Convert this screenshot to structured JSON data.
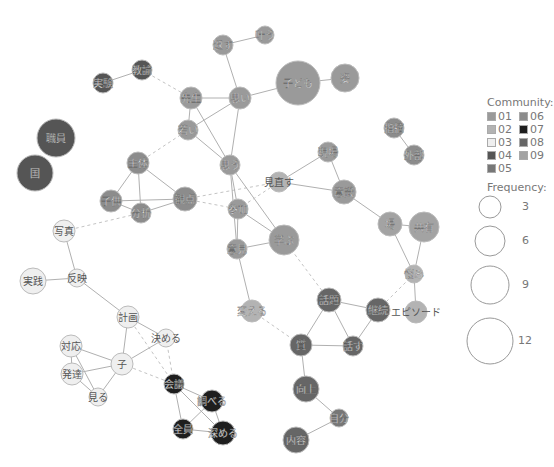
{
  "communities": {
    "01": "#9a9a9a",
    "02": "#b3b3b3",
    "03": "#efefef",
    "04": "#555555",
    "05": "#777777",
    "06": "#8c8c8c",
    "07": "#1e1e1e",
    "08": "#666666",
    "09": "#a3a3a3"
  },
  "nodes": [
    {
      "id": "kodomo",
      "label": "子ども",
      "x": 298,
      "y": 83,
      "r": 22,
      "c": "01"
    },
    {
      "id": "sugata",
      "label": "姿",
      "x": 345,
      "y": 78,
      "r": 14,
      "c": "01"
    },
    {
      "id": "kaesu",
      "label": "返す",
      "x": 223,
      "y": 45,
      "r": 10,
      "c": "01"
    },
    {
      "id": "kanau",
      "label": "叶う",
      "x": 265,
      "y": 35,
      "r": 9,
      "c": "01"
    },
    {
      "id": "sensei",
      "label": "先生",
      "x": 191,
      "y": 98,
      "r": 11,
      "c": "01"
    },
    {
      "id": "omoi",
      "label": "思い",
      "x": 240,
      "y": 98,
      "r": 11,
      "c": "01"
    },
    {
      "id": "wakai",
      "label": "若い",
      "x": 188,
      "y": 130,
      "r": 10,
      "c": "01"
    },
    {
      "id": "omou",
      "label": "思う",
      "x": 230,
      "y": 165,
      "r": 10,
      "c": "01"
    },
    {
      "id": "jikken",
      "label": "実験",
      "x": 103,
      "y": 83,
      "r": 10,
      "c": "04"
    },
    {
      "id": "kyouyu",
      "label": "教諭",
      "x": 142,
      "y": 70,
      "r": 10,
      "c": "04"
    },
    {
      "id": "shokuin",
      "label": "職員",
      "x": 56,
      "y": 138,
      "r": 19,
      "c": "04"
    },
    {
      "id": "kuni",
      "label": "国",
      "x": 35,
      "y": 173,
      "r": 18,
      "c": "04"
    },
    {
      "id": "shutai",
      "label": "主体",
      "x": 138,
      "y": 163,
      "r": 11,
      "c": "06"
    },
    {
      "id": "kodomo2",
      "label": "子供",
      "x": 111,
      "y": 201,
      "r": 11,
      "c": "06"
    },
    {
      "id": "bunseki",
      "label": "分析",
      "x": 141,
      "y": 213,
      "r": 10,
      "c": "06"
    },
    {
      "id": "kanten",
      "label": "観点",
      "x": 185,
      "y": 199,
      "r": 12,
      "c": "06"
    },
    {
      "id": "sanka",
      "label": "参加",
      "x": 238,
      "y": 209,
      "r": 10,
      "c": "01"
    },
    {
      "id": "minaosu",
      "label": "見直す",
      "x": 279,
      "y": 182,
      "r": 10,
      "c": "02"
    },
    {
      "id": "genba",
      "label": "現場",
      "x": 328,
      "y": 152,
      "r": 10,
      "c": "01"
    },
    {
      "id": "ishiki",
      "label": "意識",
      "x": 344,
      "y": 192,
      "r": 12,
      "c": "01"
    },
    {
      "id": "manabu",
      "label": "学ぶ",
      "x": 284,
      "y": 240,
      "r": 15,
      "c": "01"
    },
    {
      "id": "iken",
      "label": "意見",
      "x": 237,
      "y": 249,
      "r": 10,
      "c": "01"
    },
    {
      "id": "shiteki",
      "label": "指摘",
      "x": 394,
      "y": 128,
      "r": 10,
      "c": "06"
    },
    {
      "id": "gaibu",
      "label": "外部",
      "x": 414,
      "y": 155,
      "r": 10,
      "c": "06"
    },
    {
      "id": "ba",
      "label": "場",
      "x": 390,
      "y": 224,
      "r": 12,
      "c": "09"
    },
    {
      "id": "kyouyuu",
      "label": "共有",
      "x": 424,
      "y": 227,
      "r": 15,
      "c": "09"
    },
    {
      "id": "nayami",
      "label": "悩み",
      "x": 414,
      "y": 274,
      "r": 9,
      "c": "02"
    },
    {
      "id": "episode",
      "label": "エピソード",
      "x": 416,
      "y": 312,
      "r": 11,
      "c": "02"
    },
    {
      "id": "kaeru",
      "label": "変える",
      "x": 252,
      "y": 311,
      "r": 11,
      "c": "02"
    },
    {
      "id": "shashin",
      "label": "写真",
      "x": 64,
      "y": 231,
      "r": 11,
      "c": "03"
    },
    {
      "id": "jissen",
      "label": "実践",
      "x": 33,
      "y": 281,
      "r": 13,
      "c": "03"
    },
    {
      "id": "hanei",
      "label": "反映",
      "x": 77,
      "y": 278,
      "r": 9,
      "c": "03"
    },
    {
      "id": "keikaku",
      "label": "計画",
      "x": 128,
      "y": 317,
      "r": 11,
      "c": "03"
    },
    {
      "id": "kimeru",
      "label": "決める",
      "x": 166,
      "y": 338,
      "r": 9,
      "c": "03"
    },
    {
      "id": "taiou",
      "label": "対応",
      "x": 71,
      "y": 346,
      "r": 11,
      "c": "03"
    },
    {
      "id": "ko",
      "label": "子",
      "x": 122,
      "y": 364,
      "r": 11,
      "c": "03"
    },
    {
      "id": "hattatsu",
      "label": "発達",
      "x": 72,
      "y": 374,
      "r": 11,
      "c": "03"
    },
    {
      "id": "miru",
      "label": "見る",
      "x": 98,
      "y": 397,
      "r": 9,
      "c": "03"
    },
    {
      "id": "kaigi",
      "label": "会議",
      "x": 174,
      "y": 384,
      "r": 10,
      "c": "07"
    },
    {
      "id": "shiraberu",
      "label": "調べる",
      "x": 212,
      "y": 401,
      "r": 11,
      "c": "07"
    },
    {
      "id": "zenin",
      "label": "全員",
      "x": 183,
      "y": 429,
      "r": 10,
      "c": "07"
    },
    {
      "id": "fukameru",
      "label": "深める",
      "x": 223,
      "y": 433,
      "r": 12,
      "c": "07"
    },
    {
      "id": "wadai",
      "label": "話題",
      "x": 329,
      "y": 300,
      "r": 12,
      "c": "08"
    },
    {
      "id": "keizoku",
      "label": "継続",
      "x": 378,
      "y": 310,
      "r": 12,
      "c": "08"
    },
    {
      "id": "shitsu",
      "label": "質",
      "x": 301,
      "y": 345,
      "r": 11,
      "c": "08"
    },
    {
      "id": "hanasu",
      "label": "話す",
      "x": 353,
      "y": 346,
      "r": 10,
      "c": "08"
    },
    {
      "id": "koujou",
      "label": "向上",
      "x": 306,
      "y": 389,
      "r": 13,
      "c": "08"
    },
    {
      "id": "jigyou",
      "label": "自分",
      "x": 339,
      "y": 418,
      "r": 9,
      "c": "05"
    },
    {
      "id": "naiyou",
      "label": "内容",
      "x": 296,
      "y": 440,
      "r": 13,
      "c": "08"
    }
  ],
  "edges": [
    {
      "a": "kodomo",
      "b": "sugata",
      "dashed": false
    },
    {
      "a": "kodomo",
      "b": "omoi",
      "dashed": false
    },
    {
      "a": "kaesu",
      "b": "kanau",
      "dashed": false
    },
    {
      "a": "kaesu",
      "b": "omoi",
      "dashed": false
    },
    {
      "a": "sensei",
      "b": "omoi",
      "dashed": false
    },
    {
      "a": "sensei",
      "b": "wakai",
      "dashed": false
    },
    {
      "a": "sensei",
      "b": "omou",
      "dashed": false
    },
    {
      "a": "omoi",
      "b": "wakai",
      "dashed": false
    },
    {
      "a": "omoi",
      "b": "omou",
      "dashed": false
    },
    {
      "a": "wakai",
      "b": "omou",
      "dashed": false
    },
    {
      "a": "jikken",
      "b": "kyouyu",
      "dashed": false
    },
    {
      "a": "kyouyu",
      "b": "sensei",
      "dashed": true
    },
    {
      "a": "shiteki",
      "b": "gaibu",
      "dashed": false
    },
    {
      "a": "shutai",
      "b": "kodomo2",
      "dashed": false
    },
    {
      "a": "shutai",
      "b": "bunseki",
      "dashed": false
    },
    {
      "a": "shutai",
      "b": "kanten",
      "dashed": false
    },
    {
      "a": "kodomo2",
      "b": "bunseki",
      "dashed": false
    },
    {
      "a": "kodomo2",
      "b": "kanten",
      "dashed": false
    },
    {
      "a": "bunseki",
      "b": "kanten",
      "dashed": false
    },
    {
      "a": "shutai",
      "b": "wakai",
      "dashed": true
    },
    {
      "a": "kanten",
      "b": "minaosu",
      "dashed": true
    },
    {
      "a": "kanten",
      "b": "sanka",
      "dashed": true
    },
    {
      "a": "omou",
      "b": "sanka",
      "dashed": false
    },
    {
      "a": "omou",
      "b": "iken",
      "dashed": false
    },
    {
      "a": "omou",
      "b": "manabu",
      "dashed": false
    },
    {
      "a": "sanka",
      "b": "iken",
      "dashed": false
    },
    {
      "a": "sanka",
      "b": "manabu",
      "dashed": false
    },
    {
      "a": "sanka",
      "b": "minaosu",
      "dashed": true
    },
    {
      "a": "iken",
      "b": "manabu",
      "dashed": false
    },
    {
      "a": "iken",
      "b": "kaeru",
      "dashed": false
    },
    {
      "a": "minaosu",
      "b": "genba",
      "dashed": false
    },
    {
      "a": "minaosu",
      "b": "ishiki",
      "dashed": false
    },
    {
      "a": "genba",
      "b": "ishiki",
      "dashed": false
    },
    {
      "a": "ishiki",
      "b": "ba",
      "dashed": false
    },
    {
      "a": "ba",
      "b": "kyouyuu",
      "dashed": false
    },
    {
      "a": "ba",
      "b": "nayami",
      "dashed": false
    },
    {
      "a": "kyouyuu",
      "b": "nayami",
      "dashed": false
    },
    {
      "a": "nayami",
      "b": "episode",
      "dashed": false
    },
    {
      "a": "nayami",
      "b": "keizoku",
      "dashed": true
    },
    {
      "a": "manabu",
      "b": "wadai",
      "dashed": true
    },
    {
      "a": "kaeru",
      "b": "shitsu",
      "dashed": true
    },
    {
      "a": "wadai",
      "b": "keizoku",
      "dashed": false
    },
    {
      "a": "wadai",
      "b": "shitsu",
      "dashed": false
    },
    {
      "a": "wadai",
      "b": "hanasu",
      "dashed": false
    },
    {
      "a": "keizoku",
      "b": "hanasu",
      "dashed": false
    },
    {
      "a": "shitsu",
      "b": "hanasu",
      "dashed": false
    },
    {
      "a": "shitsu",
      "b": "koujou",
      "dashed": false
    },
    {
      "a": "koujou",
      "b": "jigyou",
      "dashed": false
    },
    {
      "a": "jigyou",
      "b": "naiyou",
      "dashed": false
    },
    {
      "a": "shashin",
      "b": "hanei",
      "dashed": false
    },
    {
      "a": "shashin",
      "b": "bunseki",
      "dashed": true
    },
    {
      "a": "jissen",
      "b": "hanei",
      "dashed": false
    },
    {
      "a": "hanei",
      "b": "keikaku",
      "dashed": false
    },
    {
      "a": "keikaku",
      "b": "kimeru",
      "dashed": false
    },
    {
      "a": "keikaku",
      "b": "ko",
      "dashed": false
    },
    {
      "a": "keikaku",
      "b": "kaigi",
      "dashed": true
    },
    {
      "a": "kimeru",
      "b": "ko",
      "dashed": false
    },
    {
      "a": "kimeru",
      "b": "kaigi",
      "dashed": true
    },
    {
      "a": "ko",
      "b": "taiou",
      "dashed": false
    },
    {
      "a": "ko",
      "b": "hattatsu",
      "dashed": false
    },
    {
      "a": "ko",
      "b": "miru",
      "dashed": false
    },
    {
      "a": "ko",
      "b": "kaigi",
      "dashed": true
    },
    {
      "a": "taiou",
      "b": "hattatsu",
      "dashed": false
    },
    {
      "a": "taiou",
      "b": "miru",
      "dashed": false
    },
    {
      "a": "hattatsu",
      "b": "miru",
      "dashed": false
    },
    {
      "a": "kaigi",
      "b": "shiraberu",
      "dashed": false
    },
    {
      "a": "kaigi",
      "b": "zenin",
      "dashed": false
    },
    {
      "a": "kaigi",
      "b": "fukameru",
      "dashed": false
    },
    {
      "a": "shiraberu",
      "b": "zenin",
      "dashed": false
    },
    {
      "a": "shiraberu",
      "b": "fukameru",
      "dashed": false
    },
    {
      "a": "zenin",
      "b": "fukameru",
      "dashed": false
    }
  ],
  "legend": {
    "community_title": "Community:",
    "community_items": [
      "01",
      "02",
      "03",
      "04",
      "05",
      "06",
      "07",
      "08",
      "09"
    ],
    "frequency_title": "Frequency:",
    "frequency_items": [
      {
        "label": "3",
        "r": 11
      },
      {
        "label": "6",
        "r": 15
      },
      {
        "label": "9",
        "r": 19
      },
      {
        "label": "12",
        "r": 23
      }
    ]
  }
}
